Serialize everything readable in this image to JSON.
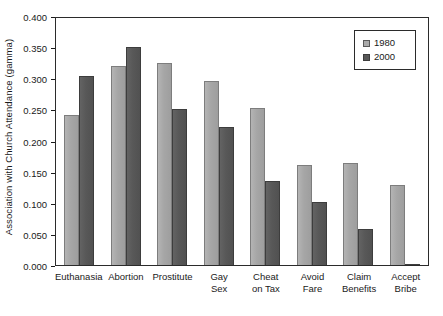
{
  "chart_data": {
    "type": "bar",
    "title": "",
    "xlabel": "",
    "ylabel": "Association with Church Attendance (gamma)",
    "ylim": [
      0.0,
      0.4
    ],
    "ytick_labels": [
      "0.400",
      "0.350",
      "0.300",
      "0.250",
      "0.200",
      "0.150",
      "0.100",
      "0.050",
      "0.000"
    ],
    "ytick_values": [
      0.4,
      0.35,
      0.3,
      0.25,
      0.2,
      0.15,
      0.1,
      0.05,
      0.0
    ],
    "grid": false,
    "legend_position": "top-right",
    "categories": [
      "Euthanasia",
      "Abortion",
      "Prostitute",
      "Gay\nSex",
      "Cheat\non Tax",
      "Avoid\nFare",
      "Claim\nBenefits",
      "Accept\nBribe"
    ],
    "series": [
      {
        "name": "1980",
        "color": "#a9a9a9",
        "values": [
          0.241,
          0.319,
          0.324,
          0.295,
          0.253,
          0.161,
          0.164,
          0.129
        ]
      },
      {
        "name": "2000",
        "color": "#595959",
        "values": [
          0.303,
          0.35,
          0.251,
          0.221,
          0.135,
          0.101,
          0.058,
          0.002
        ]
      }
    ]
  },
  "legend": {
    "items": [
      {
        "label": "1980"
      },
      {
        "label": "2000"
      }
    ]
  }
}
